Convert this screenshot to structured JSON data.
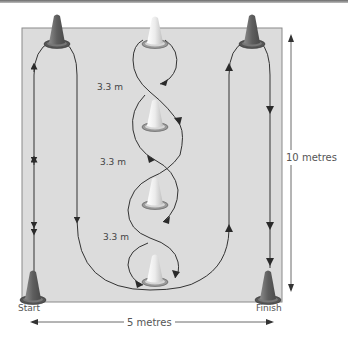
{
  "diagram": {
    "type": "drill-course",
    "field": {
      "width_label": "5 metres",
      "height_label": "10 metres",
      "fill": "#dcdcdc",
      "border": "#8a8a8a"
    },
    "labels": {
      "start": "Start",
      "finish": "Finish",
      "width": "5 metres",
      "height": "10 metres"
    },
    "weave_distances": [
      "3.3 m",
      "3.3 m",
      "3.3 m"
    ],
    "cones": [
      {
        "id": "start-cone",
        "position": "bottom-left",
        "color": "#6a6a6a"
      },
      {
        "id": "top-left-cone",
        "position": "top-left",
        "color": "#6a6a6a"
      },
      {
        "id": "weave-cone-1",
        "position": "top-center",
        "color": "#f2f2f2"
      },
      {
        "id": "weave-cone-2",
        "position": "upper-middle-center",
        "color": "#f2f2f2"
      },
      {
        "id": "weave-cone-3",
        "position": "lower-middle-center",
        "color": "#f2f2f2"
      },
      {
        "id": "weave-cone-4",
        "position": "bottom-center",
        "color": "#f2f2f2"
      },
      {
        "id": "top-right-cone",
        "position": "top-right",
        "color": "#6a6a6a"
      },
      {
        "id": "finish-cone",
        "position": "bottom-right",
        "color": "#6a6a6a"
      }
    ],
    "colors": {
      "path": "#333333",
      "dark_cone": "#6a6a6a",
      "light_cone": "#f2f2f2",
      "text": "#555555"
    }
  }
}
